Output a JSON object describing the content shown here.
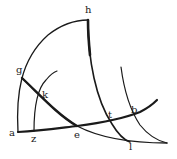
{
  "figure": {
    "type": "geometric-diagram",
    "stroke_color": "#1a1a1a",
    "background": "#ffffff"
  },
  "labels": {
    "h": "h",
    "g": "g",
    "k": "k",
    "a": "a",
    "z": "z",
    "e": "e",
    "t": "t",
    "b": "b",
    "l": "l"
  },
  "points": [
    {
      "name": "h",
      "x": 88,
      "y": 20
    },
    {
      "name": "g",
      "x": 22,
      "y": 78
    },
    {
      "name": "k",
      "x": 41,
      "y": 94
    },
    {
      "name": "a",
      "x": 18,
      "y": 132
    },
    {
      "name": "z",
      "x": 34,
      "y": 131
    },
    {
      "name": "e",
      "x": 77,
      "y": 126
    },
    {
      "name": "t",
      "x": 110,
      "y": 121
    },
    {
      "name": "b",
      "x": 132,
      "y": 115
    },
    {
      "name": "l",
      "x": 130,
      "y": 140
    }
  ]
}
